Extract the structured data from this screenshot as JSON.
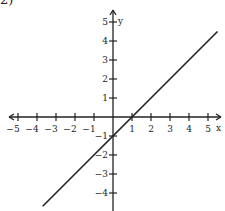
{
  "corner_label": "2)",
  "chart_data": {
    "type": "line",
    "title": "",
    "equation": "y = x - 1",
    "xlabel": "x",
    "ylabel": "y",
    "xlim": [
      -5,
      5
    ],
    "ylim": [
      -5,
      5
    ],
    "x_ticks": [
      -5,
      -4,
      -3,
      -2,
      -1,
      1,
      2,
      3,
      4,
      5
    ],
    "y_ticks": [
      5,
      4,
      3,
      2,
      1,
      -1,
      -2,
      -3,
      -4
    ],
    "grid": false,
    "series": [
      {
        "name": "line",
        "points": [
          [
            -3.7,
            -4.7
          ],
          [
            0,
            -1
          ],
          [
            1,
            0
          ],
          [
            5.5,
            4.5
          ]
        ],
        "slope": 1,
        "y_intercept": -1,
        "x_intercept": 1
      }
    ],
    "colors": {
      "axis": "#222222",
      "line": "#222222"
    }
  }
}
